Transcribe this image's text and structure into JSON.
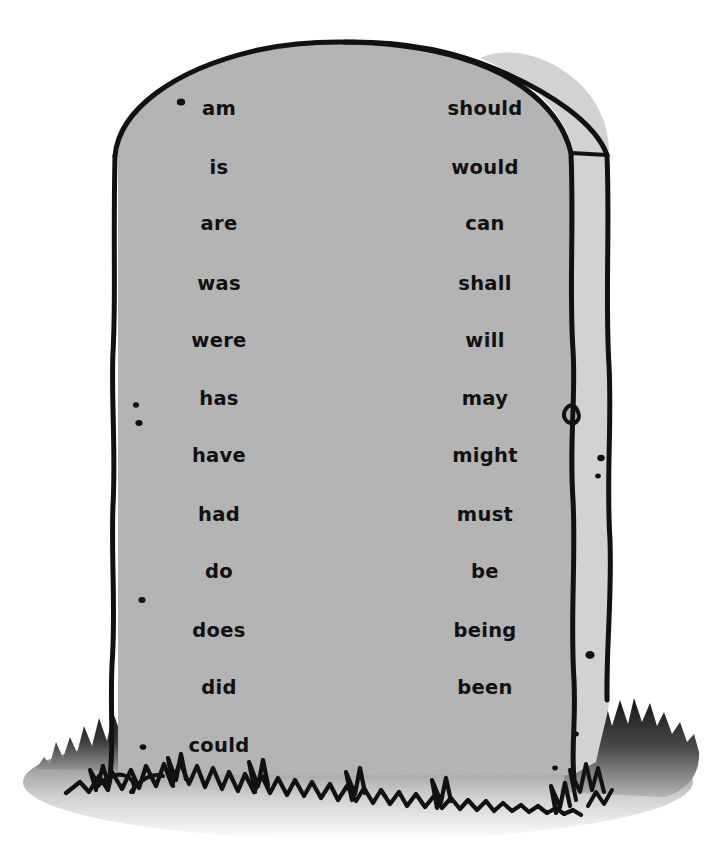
{
  "scene": {
    "title": "Helping Verbs Tombstone",
    "subject": "tombstone",
    "background_color": "#ffffff",
    "stone_face_color": "#d7d7d7",
    "stone_side_color": "#d2d2d2",
    "outline_color": "#111111",
    "grass_color": "#1a1a1a",
    "ground_shadow_color": "#7a7a7a"
  },
  "columns": {
    "left": {
      "name": "left-verb-column",
      "x": 219,
      "words": [
        {
          "text": "am",
          "y": 115
        },
        {
          "text": "is",
          "y": 174
        },
        {
          "text": "are",
          "y": 230
        },
        {
          "text": "was",
          "y": 290
        },
        {
          "text": "were",
          "y": 347
        },
        {
          "text": "has",
          "y": 405
        },
        {
          "text": "have",
          "y": 462
        },
        {
          "text": "had",
          "y": 521
        },
        {
          "text": "do",
          "y": 578
        },
        {
          "text": "does",
          "y": 637
        },
        {
          "text": "did",
          "y": 694
        },
        {
          "text": "could",
          "y": 752
        }
      ]
    },
    "right": {
      "name": "right-verb-column",
      "x": 485,
      "words": [
        {
          "text": "should",
          "y": 115
        },
        {
          "text": "would",
          "y": 174
        },
        {
          "text": "can",
          "y": 230
        },
        {
          "text": "shall",
          "y": 290
        },
        {
          "text": "will",
          "y": 347
        },
        {
          "text": "may",
          "y": 405
        },
        {
          "text": "might",
          "y": 462
        },
        {
          "text": "must",
          "y": 521
        },
        {
          "text": "be",
          "y": 578
        },
        {
          "text": "being",
          "y": 637
        },
        {
          "text": "been",
          "y": 694
        }
      ]
    }
  },
  "speckles": [
    {
      "cx": 181,
      "cy": 102,
      "r": 4.2
    },
    {
      "cx": 136,
      "cy": 405,
      "r": 3.1
    },
    {
      "cx": 139,
      "cy": 423,
      "r": 3.6
    },
    {
      "cx": 142,
      "cy": 600,
      "r": 3.6
    },
    {
      "cx": 143,
      "cy": 747,
      "r": 3.3
    },
    {
      "cx": 601,
      "cy": 458,
      "r": 3.7
    },
    {
      "cx": 598,
      "cy": 476,
      "r": 2.8
    },
    {
      "cx": 590,
      "cy": 655,
      "r": 4.6
    },
    {
      "cx": 576,
      "cy": 734,
      "r": 2.9
    },
    {
      "cx": 555,
      "cy": 768,
      "r": 2.8
    }
  ]
}
